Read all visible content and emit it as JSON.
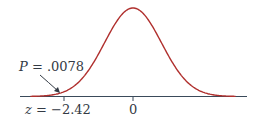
{
  "chart_data": {
    "type": "line",
    "title": "",
    "xlabel": "",
    "ylabel": "",
    "curve": "standard normal",
    "x_range": [
      -3.6,
      3.6
    ],
    "ticks": [
      {
        "value": -2.42,
        "label": "z = −2.42"
      },
      {
        "value": 0,
        "label": "0"
      }
    ],
    "annotation": {
      "text": "P = .0078",
      "points_to_z": -2.42
    },
    "grid": false,
    "legend": null,
    "colors": {
      "curve": "#b0302e",
      "axis": "#3a4a5a",
      "text": "#333a44"
    }
  },
  "labels": {
    "p_prefix": "P",
    "p_value": " = .0078",
    "z_prefix": "z",
    "z_value": " = −2.42",
    "zero": "0"
  }
}
